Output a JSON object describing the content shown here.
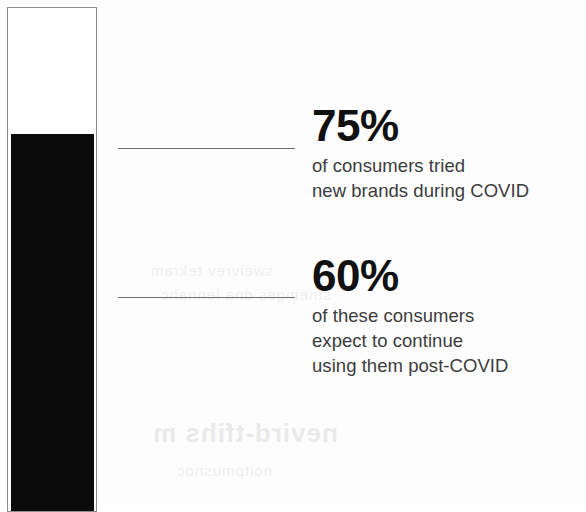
{
  "figure": {
    "type": "infographic",
    "background_color": "#fdfdfd"
  },
  "gauge": {
    "name": "vertical-bar-gauge",
    "fill_percent": 75,
    "fill_color": "#0b0b0b",
    "outline_color": "#8e8e8e",
    "track_color": "#ffffff"
  },
  "stats": [
    {
      "value": "75%",
      "description_lines": [
        "of consumers tried",
        "new brands during COVID"
      ]
    },
    {
      "value": "60%",
      "description_lines": [
        "of these consumers",
        "expect to continue",
        "using them post-COVID"
      ]
    }
  ],
  "artifacts": {
    "bleed_a": "sweivrev tekram",
    "bleed_b": "stnemges dna lennahc",
    "bleed_c": "nevird-tfihs m",
    "bleed_d": "noitpmusnoc"
  },
  "chart_data": {
    "type": "bar",
    "title": "",
    "subtitle": "",
    "xlabel": "",
    "ylabel": "",
    "orientation": "vertical",
    "grid": false,
    "legend": false,
    "ylim": [
      0,
      100
    ],
    "categories": [
      "Consumers who tried new brands during COVID"
    ],
    "values": [
      75
    ],
    "annotations": [
      {
        "value": 75,
        "label": "75%",
        "text": "of consumers tried new brands during COVID",
        "connector": "leader-line"
      },
      {
        "value": 60,
        "label": "60%",
        "text": "of these consumers expect to continue using them post-COVID",
        "connector": "leader-line"
      }
    ]
  }
}
